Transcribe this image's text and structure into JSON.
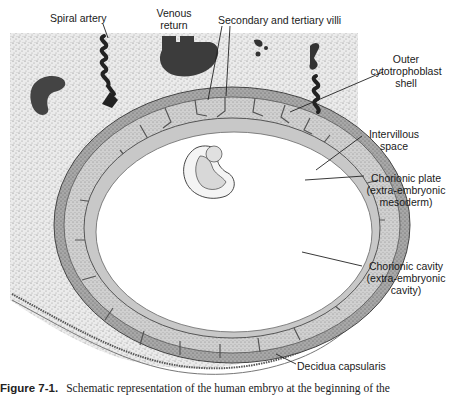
{
  "figure": {
    "labels": {
      "spiral_artery": "Spiral artery",
      "venous_return_line1": "Venous",
      "venous_return_line2": "return",
      "villi": "Secondary and tertiary villi",
      "outer_shell_line1": "Outer",
      "outer_shell_line2": "cytotrophoblast",
      "outer_shell_line3": "shell",
      "intervillous_line1": "Intervillous",
      "intervillous_line2": "space",
      "chorionic_plate_line1": "Chorionic plate",
      "chorionic_plate_line2": "(extra-embryonic",
      "chorionic_plate_line3": "mesoderm)",
      "chorionic_cavity_line1": "Chorionic cavity",
      "chorionic_cavity_line2": "(extra-embryonic",
      "chorionic_cavity_line3": "cavity)",
      "decidua_capsularis": "Decidua capsularis"
    },
    "colors": {
      "stipple_bg": "#e4e4e4",
      "vessel": "#3c3c3c",
      "shell": "#9a9a9a",
      "plate": "#bdbdbd",
      "cavity": "#ffffff"
    }
  },
  "caption": {
    "figure_number": "Figure 7-1.",
    "text": "Schematic representation of the human embryo at the beginning of the"
  }
}
